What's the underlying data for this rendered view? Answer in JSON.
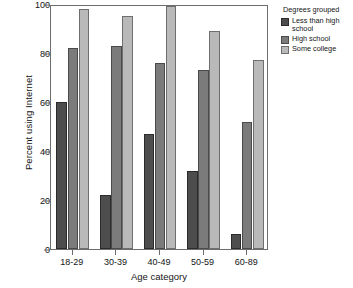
{
  "chart_data": {
    "type": "bar",
    "title": "",
    "subtitle": "",
    "xlabel": "Age category",
    "ylabel": "Percent using Internet",
    "categories": [
      "18-29",
      "30-39",
      "40-49",
      "50-59",
      "60-89"
    ],
    "series": [
      {
        "name": "Less than high school",
        "color": "#4d4d4d",
        "values": [
          60,
          22,
          47,
          32,
          6
        ]
      },
      {
        "name": "High school",
        "color": "#7b7b7b",
        "values": [
          82,
          83,
          76,
          73,
          52
        ]
      },
      {
        "name": "Some college",
        "color": "#b9b9b9",
        "values": [
          98,
          95,
          99,
          89,
          77
        ]
      }
    ],
    "ylim": [
      0,
      100
    ],
    "yticks": [
      0,
      20,
      40,
      60,
      80,
      100
    ],
    "ytick_labels": [
      "0",
      "20",
      "40",
      "60",
      "80",
      "100"
    ],
    "grid": false,
    "legend_position": "right",
    "legend_title": "Degrees grouped",
    "frame_color": "#6d6d6d",
    "background_color": "#ffffff"
  }
}
